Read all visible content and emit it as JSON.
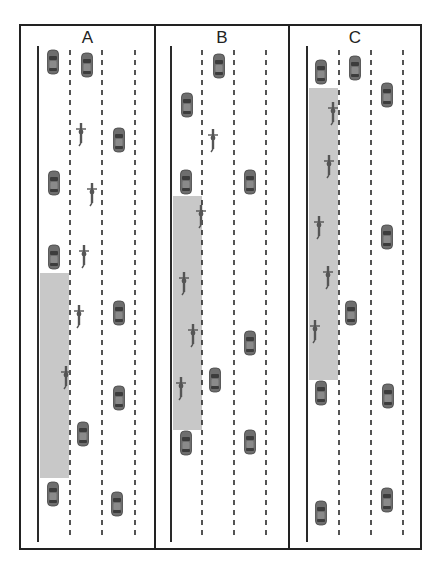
{
  "figure": {
    "width": 439,
    "height": 566,
    "colors": {
      "border": "#222222",
      "lane_line": "#2a2a2a",
      "zone": "#c8c8c8",
      "car": "#6e6e6e",
      "cyclist": "#555555"
    },
    "panels": [
      {
        "label": "A",
        "x": 19,
        "y": 24,
        "w": 137,
        "h": 526,
        "edge_line_x": 38,
        "dashed_lines_x": [
          70,
          102,
          135
        ],
        "zone": {
          "x": 40,
          "y": 273,
          "w": 29,
          "h": 205
        },
        "cars": [
          [
            53,
            62
          ],
          [
            87,
            65
          ],
          [
            119,
            140
          ],
          [
            54,
            183
          ],
          [
            54,
            257
          ],
          [
            119,
            313
          ],
          [
            119,
            398
          ],
          [
            83,
            434
          ],
          [
            53,
            494
          ],
          [
            117,
            504
          ]
        ],
        "cyclists": [
          [
            81,
            133
          ],
          [
            92,
            193
          ],
          [
            84,
            255
          ],
          [
            79,
            315
          ],
          [
            66,
            376
          ]
        ]
      },
      {
        "label": "B",
        "x": 154,
        "y": 24,
        "w": 136,
        "h": 526,
        "edge_line_x": 171,
        "dashed_lines_x": [
          202,
          234,
          266
        ],
        "zone": {
          "x": 173,
          "y": 196,
          "w": 29,
          "h": 234
        },
        "cars": [
          [
            219,
            66
          ],
          [
            187,
            105
          ],
          [
            186,
            182
          ],
          [
            250,
            182
          ],
          [
            250,
            343
          ],
          [
            215,
            380
          ],
          [
            186,
            443
          ],
          [
            250,
            442
          ]
        ],
        "cyclists": [
          [
            213,
            139
          ],
          [
            201,
            215
          ],
          [
            184,
            282
          ],
          [
            193,
            334
          ],
          [
            181,
            387
          ]
        ]
      },
      {
        "label": "C",
        "x": 288,
        "y": 24,
        "w": 134,
        "h": 526,
        "edge_line_x": 307,
        "dashed_lines_x": [
          339,
          371,
          403
        ],
        "zone": {
          "x": 309,
          "y": 88,
          "w": 29,
          "h": 292
        },
        "cars": [
          [
            321,
            72
          ],
          [
            355,
            68
          ],
          [
            387,
            95
          ],
          [
            387,
            237
          ],
          [
            351,
            313
          ],
          [
            321,
            393
          ],
          [
            388,
            396
          ],
          [
            321,
            513
          ],
          [
            387,
            500
          ]
        ],
        "cyclists": [
          [
            333,
            112
          ],
          [
            329,
            165
          ],
          [
            319,
            226
          ],
          [
            328,
            276
          ],
          [
            315,
            330
          ]
        ]
      }
    ],
    "line_top": 46,
    "line_bottom": 542
  }
}
